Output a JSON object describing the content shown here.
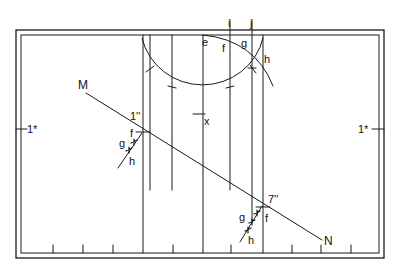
{
  "diagram": {
    "type": "descriptive-geometry construction",
    "stroke_color": "#1a1a1a",
    "background": "#ffffff",
    "frame": {
      "outer": [
        16,
        30,
        384,
        258
      ],
      "inner": [
        21,
        35,
        379,
        253
      ]
    },
    "labels": {
      "M": "M",
      "N": "N",
      "one_dbl_prime": "1''",
      "seven_dbl_prime": "7''",
      "one_star_left": "1*",
      "one_star_right": "1*",
      "i": "i",
      "j": "j",
      "e": "e",
      "f_top": "f",
      "g_top": "g",
      "h_top": "h",
      "x": "x",
      "f_left": "f",
      "g_left": "g",
      "h_left": "h",
      "f_right": "f",
      "g_right": "g",
      "h_right": "h"
    },
    "line_MN": {
      "from": [
        86,
        93
      ],
      "to": [
        322,
        240
      ]
    },
    "vertical_lines_x": [
      143,
      150,
      172,
      203,
      231,
      255,
      263
    ],
    "bottom_ticks_x": [
      53,
      83,
      113,
      173,
      231,
      292,
      321,
      351
    ]
  }
}
